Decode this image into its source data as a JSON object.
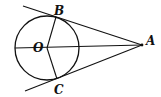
{
  "diagram": {
    "type": "geometry",
    "colors": {
      "stroke": "#111111",
      "background": "#ffffff"
    },
    "circle": {
      "center_label": "O",
      "cx": 47,
      "cy": 48,
      "r": 32
    },
    "points": {
      "A": {
        "label": "A",
        "x": 142,
        "y": 45
      },
      "B": {
        "label": "B",
        "x": 57,
        "y": 17
      },
      "C": {
        "label": "C",
        "x": 57,
        "y": 79
      },
      "O": {
        "label": "O",
        "x": 47,
        "y": 48
      }
    },
    "labels": {
      "A": "A",
      "B": "B",
      "C": "C",
      "O": "O"
    },
    "segments": [
      {
        "name": "tangent-AB",
        "from": "A",
        "to": "B",
        "extended": true
      },
      {
        "name": "tangent-AC",
        "from": "A",
        "to": "C",
        "extended": true
      },
      {
        "name": "segment-OA",
        "from": "O",
        "to": "A",
        "extends_to_circle_left": true
      },
      {
        "name": "radius-OB",
        "from": "O",
        "to": "B"
      },
      {
        "name": "radius-OC",
        "from": "O",
        "to": "C"
      }
    ]
  }
}
